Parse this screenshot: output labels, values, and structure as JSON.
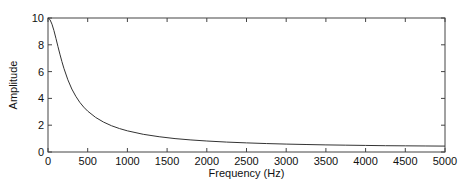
{
  "chart_data": {
    "type": "line",
    "title": "",
    "xlabel": "Frequency (Hz)",
    "ylabel": "Amplitude",
    "xlim": [
      0,
      5000
    ],
    "ylim": [
      0,
      10
    ],
    "xticks": [
      0,
      500,
      1000,
      1500,
      2000,
      2500,
      3000,
      3500,
      4000,
      4500,
      5000
    ],
    "yticks": [
      0,
      2,
      4,
      6,
      8,
      10
    ],
    "xtick_labels": [
      "0",
      "500",
      "1000",
      "1500",
      "2000",
      "2500",
      "3000",
      "3500",
      "4000",
      "4500",
      "5000"
    ],
    "ytick_labels": [
      "0",
      "2",
      "4",
      "6",
      "8",
      "10"
    ],
    "grid": false,
    "legend": null,
    "series": [
      {
        "name": "amplitude-response",
        "color": "#333333",
        "x": [
          0,
          25,
          50,
          75,
          100,
          125,
          150,
          175,
          200,
          250,
          300,
          350,
          400,
          450,
          500,
          600,
          700,
          800,
          900,
          1000,
          1200,
          1400,
          1600,
          1800,
          2000,
          2250,
          2500,
          2750,
          3000,
          3250,
          3500,
          3750,
          4000,
          4250,
          4500,
          4750,
          5000
        ],
        "y": [
          10.0,
          9.88,
          9.54,
          9.06,
          8.48,
          7.88,
          7.3,
          6.75,
          6.25,
          5.39,
          4.7,
          4.16,
          3.71,
          3.35,
          3.05,
          2.58,
          2.23,
          1.96,
          1.75,
          1.58,
          1.32,
          1.14,
          1.0,
          0.9,
          0.82,
          0.74,
          0.68,
          0.63,
          0.59,
          0.56,
          0.53,
          0.51,
          0.49,
          0.47,
          0.46,
          0.45,
          0.44
        ]
      }
    ]
  }
}
